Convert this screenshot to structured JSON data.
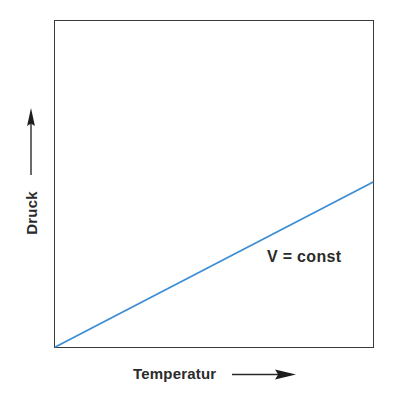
{
  "chart_data": {
    "type": "line",
    "title": "",
    "subtitle": "",
    "xlabel": "Temperatur",
    "ylabel": "Druck",
    "xlabel_arrow": "arrow-right",
    "ylabel_arrow": "arrow-up",
    "x_tick_labels": [],
    "y_tick_labels": [],
    "grid": false,
    "legend": null,
    "legend_position": "none",
    "xlim": [
      0,
      1
    ],
    "ylim": [
      0,
      1
    ],
    "series": [
      {
        "name": "V = const",
        "color": "#3d8dd4",
        "line_width": 1.8,
        "x": [
          0,
          1
        ],
        "y": [
          0,
          0.506
        ],
        "annotation": "V = const"
      }
    ],
    "annotations": [
      {
        "text": "V = const",
        "x": 0.665,
        "y": 0.3
      }
    ],
    "axes": {
      "frame": true,
      "frame_color": "#3a3a3a",
      "background": "#ffffff"
    }
  },
  "figure": {
    "background_color": "#ffffff",
    "frame_color": "#3a3a3a",
    "line_color": "#3d8dd4",
    "text_color": "#2b2b2b",
    "y_axis_label": "Druck",
    "x_axis_label": "Temperatur",
    "curve_label": "V = const",
    "y_arrow_icon": "arrow-up-icon",
    "x_arrow_icon": "arrow-right-icon"
  }
}
